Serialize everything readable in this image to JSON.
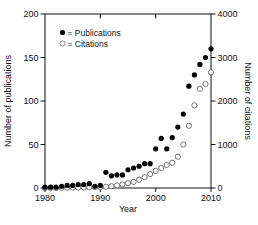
{
  "chart_data": {
    "type": "scatter",
    "title": "",
    "xlabel": "Year",
    "ylabel_left": "Number of publications",
    "ylabel_right": "Number of citations",
    "xlim": [
      1980,
      2010
    ],
    "ylim_left": [
      0,
      200
    ],
    "ylim_right": [
      0,
      4000
    ],
    "xticks": [
      "1980",
      "1990",
      "2000",
      "2010"
    ],
    "yticks_left": [
      "0",
      "50",
      "100",
      "150",
      "200"
    ],
    "yticks_right": [
      "0",
      "1000",
      "2000",
      "3000",
      "4000"
    ],
    "grid": false,
    "legend_position": "upper-left-inside",
    "legend": [
      {
        "marker": "filled-circle",
        "label": "= Publications"
      },
      {
        "marker": "open-circle",
        "label": "= Citations"
      }
    ],
    "x": [
      1980,
      1981,
      1982,
      1983,
      1984,
      1985,
      1986,
      1987,
      1988,
      1989,
      1990,
      1991,
      1992,
      1993,
      1994,
      1995,
      1996,
      1997,
      1998,
      1999,
      2000,
      2001,
      2002,
      2003,
      2004,
      2005,
      2006,
      2007,
      2008,
      2009,
      2010
    ],
    "series": [
      {
        "name": "Publications",
        "axis": "left",
        "marker": "filled-circle",
        "values": [
          1,
          1,
          1,
          2,
          3,
          3,
          4,
          4,
          5,
          2,
          3,
          18,
          14,
          15,
          15,
          21,
          23,
          25,
          28,
          28,
          45,
          57,
          45,
          58,
          70,
          85,
          117,
          130,
          142,
          150,
          160
        ]
      },
      {
        "name": "Citations",
        "axis": "right",
        "marker": "open-circle",
        "values": [
          0,
          0,
          0,
          5,
          5,
          10,
          10,
          15,
          15,
          20,
          20,
          30,
          40,
          60,
          80,
          110,
          140,
          190,
          250,
          320,
          390,
          460,
          530,
          580,
          720,
          1000,
          1430,
          1900,
          2280,
          2390,
          2660
        ]
      }
    ],
    "colors": {
      "marker": "#000000",
      "axis": "#000000",
      "background": "#ffffff",
      "open_marker_fill": "#ffffff"
    }
  }
}
